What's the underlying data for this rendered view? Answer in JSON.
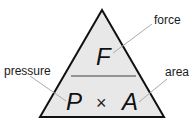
{
  "diagram": {
    "colors": {
      "fill": "#e8e8e8",
      "stroke": "#111111",
      "divider": "#777777",
      "leader": "#aaaaaa"
    },
    "top": {
      "symbol": "F",
      "label": "force"
    },
    "bottom_left": {
      "symbol": "P",
      "label": "pressure"
    },
    "operator": "×",
    "bottom_right": {
      "symbol": "A",
      "label": "area"
    }
  }
}
